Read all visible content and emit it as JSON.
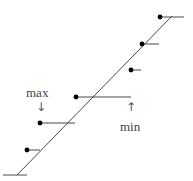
{
  "diagram": {
    "diagonal": {
      "x1": 17,
      "y1": 175,
      "x2": 172,
      "y2": 16
    },
    "baseline": {
      "x1": 3,
      "y1": 175,
      "x2": 27,
      "y2": 175
    },
    "steps": [
      {
        "dot": [
          27,
          150
        ],
        "end": 40
      },
      {
        "dot": [
          40,
          123
        ],
        "end": 75
      },
      {
        "dot": [
          76,
          97
        ],
        "end": 131
      },
      {
        "dot": [
          131,
          70
        ],
        "end": 141
      },
      {
        "dot": [
          142,
          44
        ],
        "end": 159
      },
      {
        "dot": [
          160,
          17
        ],
        "end": 184
      }
    ],
    "labels": {
      "max": "max",
      "min": "min",
      "down_arrow": "↓",
      "up_arrow": "↑"
    }
  }
}
